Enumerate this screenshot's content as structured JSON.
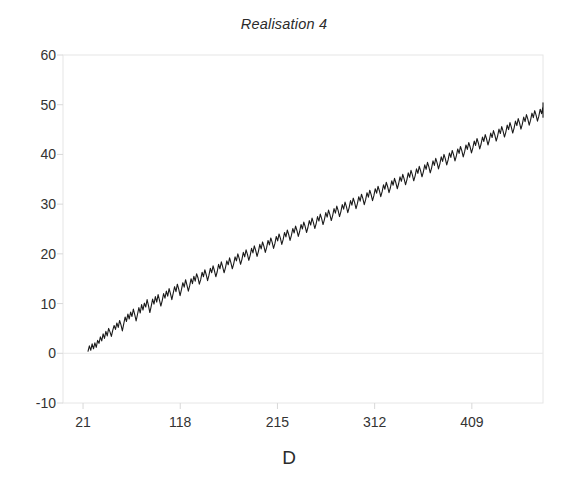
{
  "chart_data": {
    "type": "line",
    "title": "Realisation 4",
    "xlabel": "D",
    "ylabel": "",
    "xlim": [
      1,
      480
    ],
    "ylim": [
      -10,
      60
    ],
    "grid": false,
    "legend": "none",
    "xticks": [
      21,
      118,
      215,
      312,
      409
    ],
    "xtick_labels": [
      "21",
      "118",
      "215",
      "312",
      "409"
    ],
    "yticks": [
      -10,
      0,
      10,
      20,
      30,
      40,
      50,
      60
    ],
    "ytick_labels": [
      "-10",
      "0",
      "10",
      "20",
      "30",
      "40",
      "50",
      "60"
    ],
    "series": [
      {
        "name": "Realisation 4",
        "color": "#1a1a1a",
        "x_start": 1,
        "x_step": 1,
        "values": [
          0.4,
          1.5,
          0.6,
          1.9,
          0.9,
          2.1,
          1.2,
          2.6,
          2.0,
          3.3,
          2.5,
          3.9,
          3.0,
          4.4,
          3.5,
          5.0,
          4.3,
          3.4,
          4.6,
          5.6,
          4.8,
          6.1,
          5.2,
          6.6,
          5.7,
          4.5,
          5.9,
          7.3,
          6.4,
          7.9,
          6.9,
          8.3,
          7.4,
          8.9,
          7.8,
          6.5,
          7.8,
          9.2,
          8.1,
          9.8,
          8.7,
          10.1,
          9.3,
          10.8,
          9.6,
          8.2,
          9.5,
          10.9,
          9.9,
          11.4,
          10.3,
          11.8,
          10.7,
          9.5,
          10.6,
          12.0,
          11.1,
          12.5,
          11.5,
          13.0,
          12.0,
          10.8,
          12.1,
          13.4,
          12.4,
          13.9,
          12.9,
          11.6,
          12.8,
          14.2,
          13.3,
          14.8,
          13.7,
          12.5,
          13.6,
          15.0,
          14.0,
          15.5,
          14.5,
          16.0,
          15.2,
          13.9,
          14.8,
          16.3,
          15.4,
          16.8,
          15.8,
          14.6,
          15.7,
          17.1,
          16.2,
          17.6,
          16.6,
          15.4,
          16.4,
          17.9,
          17.0,
          18.4,
          17.4,
          16.2,
          17.2,
          18.6,
          17.8,
          19.2,
          18.2,
          17.0,
          18.0,
          19.4,
          18.6,
          20.0,
          19.1,
          17.9,
          18.9,
          20.3,
          19.4,
          20.8,
          19.9,
          18.7,
          19.7,
          21.1,
          20.2,
          21.6,
          20.7,
          19.5,
          20.5,
          21.9,
          21.0,
          22.4,
          21.5,
          20.3,
          21.3,
          22.7,
          21.8,
          23.2,
          22.3,
          21.1,
          22.1,
          23.5,
          22.6,
          24.0,
          23.1,
          21.9,
          22.9,
          24.3,
          23.4,
          24.8,
          23.9,
          22.7,
          23.7,
          25.1,
          24.2,
          25.6,
          24.7,
          23.5,
          24.5,
          25.9,
          25.0,
          26.4,
          25.5,
          24.3,
          25.3,
          26.7,
          25.8,
          27.2,
          26.3,
          25.1,
          26.1,
          27.5,
          26.6,
          28.0,
          27.1,
          25.9,
          26.9,
          28.3,
          27.4,
          28.8,
          27.9,
          26.7,
          27.7,
          29.1,
          28.2,
          29.6,
          28.7,
          27.5,
          28.5,
          29.9,
          29.0,
          30.4,
          29.5,
          28.3,
          29.3,
          30.7,
          29.8,
          31.2,
          30.3,
          29.1,
          30.1,
          31.5,
          30.6,
          32.0,
          31.1,
          29.9,
          30.9,
          32.3,
          31.4,
          32.8,
          31.9,
          30.7,
          31.7,
          33.1,
          32.2,
          33.6,
          32.7,
          31.5,
          32.5,
          33.9,
          33.0,
          34.4,
          33.5,
          32.3,
          33.3,
          34.7,
          33.8,
          35.2,
          34.3,
          33.1,
          34.1,
          35.5,
          34.6,
          36.0,
          35.1,
          33.9,
          34.9,
          36.3,
          35.4,
          36.8,
          35.9,
          34.7,
          35.7,
          37.1,
          36.2,
          37.6,
          36.7,
          35.5,
          36.5,
          37.9,
          37.0,
          38.4,
          37.5,
          36.3,
          37.3,
          38.7,
          37.8,
          39.2,
          38.3,
          37.1,
          38.1,
          39.5,
          38.6,
          40.0,
          39.1,
          37.9,
          38.9,
          40.3,
          39.4,
          40.8,
          39.9,
          38.7,
          39.7,
          41.1,
          40.2,
          41.6,
          40.7,
          39.5,
          40.5,
          41.9,
          41.0,
          42.4,
          41.5,
          40.3,
          41.3,
          42.7,
          41.8,
          43.2,
          42.3,
          41.1,
          42.1,
          43.5,
          42.6,
          44.0,
          43.1,
          41.9,
          42.9,
          44.3,
          43.4,
          44.8,
          43.9,
          42.7,
          43.7,
          45.1,
          44.2,
          45.6,
          44.7,
          43.5,
          44.5,
          45.9,
          45.0,
          46.4,
          45.5,
          44.3,
          45.3,
          46.7,
          45.8,
          47.2,
          46.3,
          45.1,
          46.1,
          47.5,
          46.6,
          48.0,
          47.1,
          45.9,
          46.9,
          48.3,
          47.4,
          48.8,
          47.9,
          46.7,
          47.7,
          49.1,
          48.2,
          49.6,
          48.7,
          47.5,
          48.5,
          49.9,
          49.0,
          50.4
        ],
        "start_value": 0,
        "end_value": 50,
        "description": "Random walk with positive drift rising from about 0 to about 50"
      }
    ],
    "axis_color": "#e6e6e6",
    "line_color": "#1a1a1a",
    "background": "#ffffff"
  }
}
